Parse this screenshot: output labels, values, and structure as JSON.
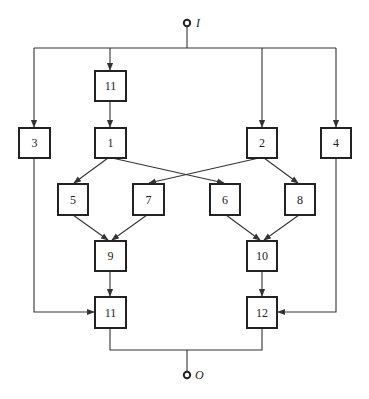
{
  "diagram": {
    "type": "block-diagram",
    "input": {
      "label": "I",
      "x": 187,
      "y": 23
    },
    "output": {
      "label": "O",
      "x": 187,
      "y": 375
    },
    "colors": {
      "line": "#333333",
      "box_border": "#222222",
      "background": "#ffffff"
    },
    "nodes": [
      {
        "id": "n11a",
        "label": "11",
        "x": 95,
        "y": 71,
        "w": 31,
        "h": 30
      },
      {
        "id": "n3",
        "label": "3",
        "x": 19,
        "y": 128,
        "w": 31,
        "h": 30
      },
      {
        "id": "n1",
        "label": "1",
        "x": 95,
        "y": 128,
        "w": 31,
        "h": 30
      },
      {
        "id": "n2",
        "label": "2",
        "x": 247,
        "y": 128,
        "w": 30,
        "h": 30
      },
      {
        "id": "n4",
        "label": "4",
        "x": 321,
        "y": 128,
        "w": 30,
        "h": 30
      },
      {
        "id": "n5",
        "label": "5",
        "x": 58,
        "y": 184,
        "w": 30,
        "h": 31
      },
      {
        "id": "n7",
        "label": "7",
        "x": 133,
        "y": 184,
        "w": 31,
        "h": 31
      },
      {
        "id": "n6",
        "label": "6",
        "x": 210,
        "y": 184,
        "w": 30,
        "h": 31
      },
      {
        "id": "n8",
        "label": "8",
        "x": 285,
        "y": 184,
        "w": 30,
        "h": 31
      },
      {
        "id": "n9",
        "label": "9",
        "x": 95,
        "y": 241,
        "w": 31,
        "h": 30
      },
      {
        "id": "n10",
        "label": "10",
        "x": 247,
        "y": 241,
        "w": 30,
        "h": 30
      },
      {
        "id": "n11b",
        "label": "11",
        "x": 95,
        "y": 297,
        "w": 31,
        "h": 31
      },
      {
        "id": "n12",
        "label": "12",
        "x": 247,
        "y": 297,
        "w": 30,
        "h": 31
      }
    ],
    "edges": [
      {
        "from": "I",
        "to": "n3"
      },
      {
        "from": "I",
        "to": "n11a"
      },
      {
        "from": "I",
        "to": "n2"
      },
      {
        "from": "I",
        "to": "n4"
      },
      {
        "from": "n11a",
        "to": "n1"
      },
      {
        "from": "n1",
        "to": "n5"
      },
      {
        "from": "n1",
        "to": "n6"
      },
      {
        "from": "n2",
        "to": "n7"
      },
      {
        "from": "n2",
        "to": "n8"
      },
      {
        "from": "n5",
        "to": "n9"
      },
      {
        "from": "n7",
        "to": "n9"
      },
      {
        "from": "n6",
        "to": "n10"
      },
      {
        "from": "n8",
        "to": "n10"
      },
      {
        "from": "n9",
        "to": "n11b"
      },
      {
        "from": "n3",
        "to": "n11b"
      },
      {
        "from": "n10",
        "to": "n12"
      },
      {
        "from": "n4",
        "to": "n12"
      },
      {
        "from": "n11b",
        "to": "O"
      },
      {
        "from": "n12",
        "to": "O"
      }
    ]
  }
}
